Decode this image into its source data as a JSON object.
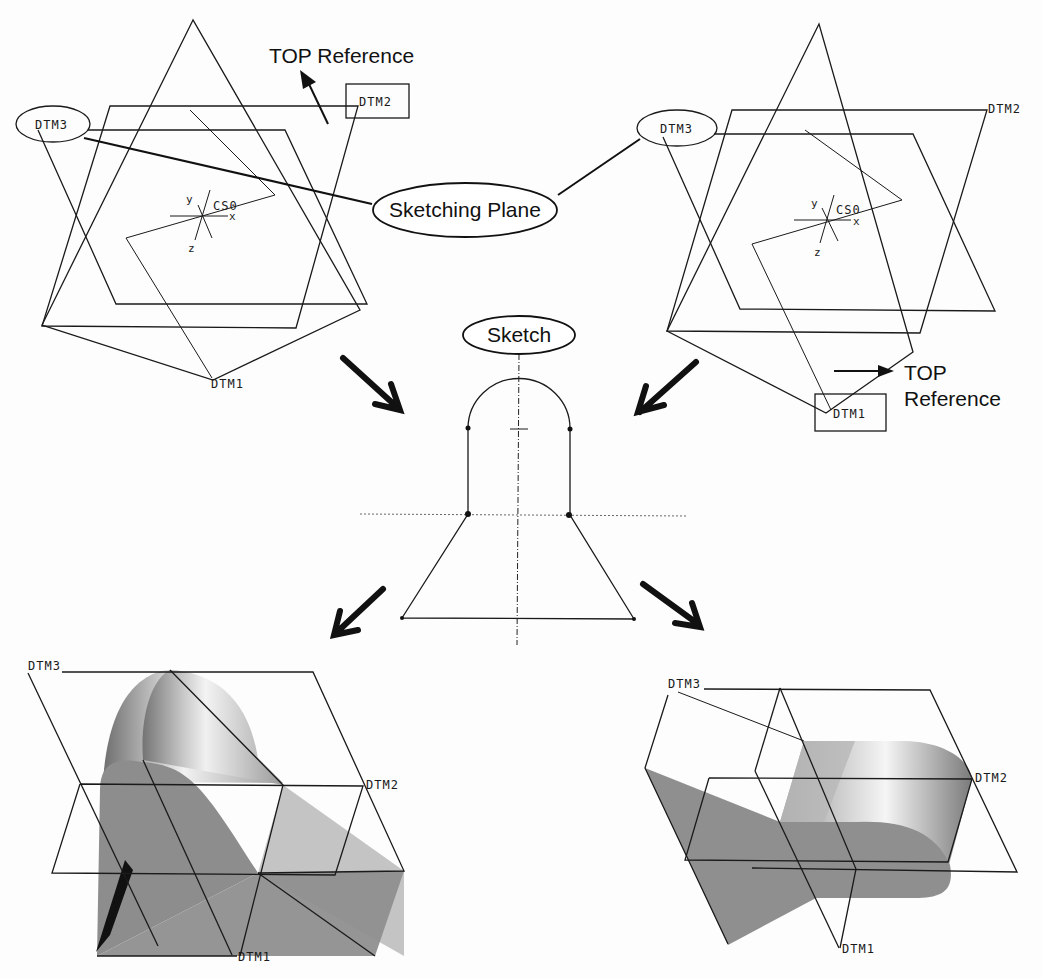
{
  "figure": {
    "top_left_view": {
      "datums": {
        "dtm1": "DTM1",
        "dtm2": "DTM2",
        "dtm3": "DTM3"
      },
      "csys": {
        "name": "CS0",
        "x": "x",
        "y": "y",
        "z": "z"
      },
      "top_reference_label": "TOP Reference",
      "top_reference_target": "DTM2",
      "sketching_plane_target": "DTM3"
    },
    "top_right_view": {
      "datums": {
        "dtm1": "DTM1",
        "dtm2": "DTM2",
        "dtm3": "DTM3"
      },
      "csys": {
        "name": "CS0",
        "x": "x",
        "y": "y",
        "z": "z"
      },
      "top_reference_label_line1": "TOP",
      "top_reference_label_line2": "Reference",
      "top_reference_target": "DTM1",
      "sketching_plane_target": "DTM3"
    },
    "callouts": {
      "sketching_plane": "Sketching Plane",
      "sketch": "Sketch"
    },
    "bottom_left_result": {
      "datums": {
        "dtm1": "DTM1",
        "dtm2": "DTM2",
        "dtm3": "DTM3"
      }
    },
    "bottom_right_result": {
      "datums": {
        "dtm1": "DTM1",
        "dtm2": "DTM2",
        "dtm3": "DTM3"
      }
    },
    "colors": {
      "line": "#1a1a1a",
      "solid_dark": "#8a8a8a",
      "solid_mid": "#b5b5b5",
      "solid_light": "#e4e4e4"
    }
  }
}
